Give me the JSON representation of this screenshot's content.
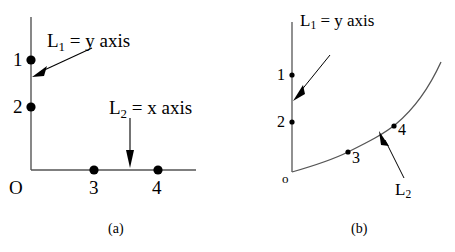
{
  "figure": {
    "panels": [
      {
        "id": "a",
        "caption": "(a)",
        "annotations": {
          "l1_label": "L₁ = y axis",
          "l1_label_text": "L",
          "l1_sub": "1",
          "l1_rest": " = y axis",
          "l2_label_text": "L",
          "l2_sub": "2",
          "l2_rest": " = x axis"
        },
        "origin_label": "O",
        "y_axis_points": [
          {
            "label": "1",
            "x": 31,
            "y": 60
          },
          {
            "label": "2",
            "x": 31,
            "y": 107
          }
        ],
        "x_axis_points": [
          {
            "label": "3",
            "x": 94,
            "y": 170
          },
          {
            "label": "4",
            "x": 158,
            "y": 170
          }
        ]
      },
      {
        "id": "b",
        "caption": "(b)",
        "annotations": {
          "l1_label_text": "L",
          "l1_sub": "1",
          "l1_rest": " = y axis",
          "l2_label_text": "L",
          "l2_sub": "2"
        },
        "origin_label": "o",
        "y_axis_points": [
          {
            "label": "1",
            "x": 292,
            "y": 75
          },
          {
            "label": "2",
            "x": 292,
            "y": 122
          }
        ],
        "curve_points": [
          {
            "label": "3",
            "x": 348,
            "y": 152
          },
          {
            "label": "4",
            "x": 394,
            "y": 126
          }
        ]
      }
    ],
    "colors": {
      "ink": "#000000",
      "line": "#555555",
      "background": "#ffffff"
    }
  }
}
